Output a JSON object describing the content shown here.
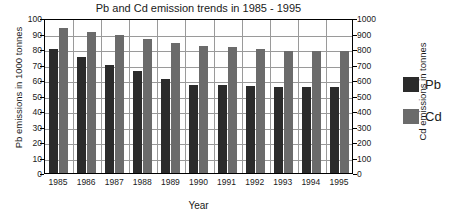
{
  "chart_data": {
    "type": "bar",
    "title": "Pb and Cd emission trends in 1985 - 1995",
    "xlabel": "Year",
    "ylabel": "Pb emissions in 1000 tonnes",
    "ylabel_secondary": "Cd emissions in tonnes",
    "categories": [
      "1985",
      "1986",
      "1987",
      "1988",
      "1989",
      "1990",
      "1991",
      "1992",
      "1993",
      "1994",
      "1995"
    ],
    "series": [
      {
        "name": "Pb",
        "axis": "left",
        "color": "#2b2b2b",
        "values": [
          80,
          75,
          70,
          65.5,
          60.5,
          57,
          56.5,
          56,
          55.5,
          55.5,
          55.5
        ]
      },
      {
        "name": "Cd",
        "axis": "right",
        "color": "#6b6b6b",
        "values": [
          935,
          910,
          888,
          863,
          838,
          820,
          812,
          802,
          790,
          790,
          790
        ]
      }
    ],
    "ylim": [
      0,
      100
    ],
    "ylim_secondary": [
      0,
      1000
    ],
    "yticks": [
      "100",
      "90",
      "80",
      "70",
      "60",
      "50",
      "40",
      "30",
      "20",
      "10",
      "0"
    ],
    "yticks_secondary": [
      "1000",
      "900",
      "800",
      "700",
      "600",
      "500",
      "400",
      "300",
      "200",
      "100",
      "0"
    ],
    "grid": true,
    "legend_position": "right",
    "legend": [
      {
        "label": "Pb",
        "color": "#2b2b2b"
      },
      {
        "label": "Cd",
        "color": "#6b6b6b"
      }
    ]
  }
}
